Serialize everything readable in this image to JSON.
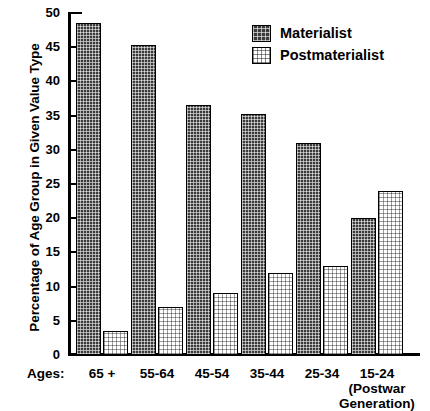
{
  "chart_data": {
    "type": "bar",
    "title": "",
    "xlabel": "Ages:",
    "ylabel": "Percentage of Age Group in Given Value Type",
    "ylim": [
      0,
      50
    ],
    "yticks": [
      0,
      5,
      10,
      15,
      20,
      25,
      30,
      35,
      40,
      45,
      50
    ],
    "grid": false,
    "legend_position": "top-right",
    "categories": [
      "65 +",
      "55-64",
      "45-54",
      "35-44",
      "25-34",
      "15-24"
    ],
    "category_sublabels": [
      "",
      "",
      "",
      "",
      "",
      "(Postwar Generation)"
    ],
    "series": [
      {
        "name": "Materialist",
        "values": [
          48.5,
          45.3,
          36.5,
          35.2,
          31.0,
          20.0
        ],
        "color": "#3b3b3b"
      },
      {
        "name": "Postmaterialist",
        "values": [
          3.5,
          7.0,
          9.0,
          12.0,
          13.0,
          24.0
        ],
        "color": "#ffffff"
      }
    ]
  },
  "axis": {
    "y_title": "Percentage of Age Group in Given Value Type",
    "x_prefix": "Ages:",
    "tick_labels": [
      "50",
      "45",
      "40",
      "35",
      "30",
      "25",
      "20",
      "15",
      "10",
      "5",
      "0"
    ]
  },
  "legend": {
    "items": [
      {
        "label": "Materialist"
      },
      {
        "label": "Postmaterialist"
      }
    ]
  },
  "categories": [
    {
      "label": "65 +",
      "sub": ""
    },
    {
      "label": "55-64",
      "sub": ""
    },
    {
      "label": "45-54",
      "sub": ""
    },
    {
      "label": "35-44",
      "sub": ""
    },
    {
      "label": "25-34",
      "sub": ""
    },
    {
      "label": "15-24",
      "sub_line1": "(Postwar",
      "sub_line2": "Generation)"
    }
  ]
}
